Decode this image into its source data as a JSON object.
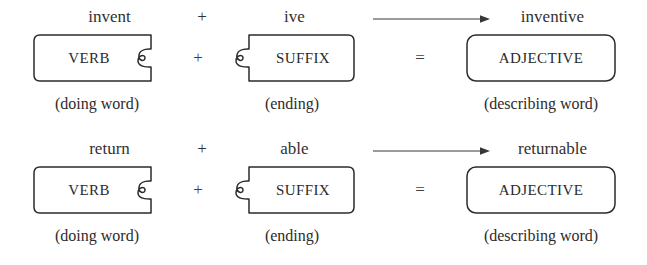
{
  "diagram": {
    "ink_color": "#2b2b2b",
    "background_color": "#ffffff",
    "operators": {
      "plus": "+",
      "equals": "=",
      "arrow": "arrow-right-icon"
    },
    "blocks": {
      "verb": {
        "label": "VERB",
        "caption": "(doing word)",
        "shape": "puzzle-piece-socket-right"
      },
      "suffix": {
        "label": "SUFFIX",
        "caption": "(ending)",
        "shape": "puzzle-piece-tab-left"
      },
      "adjective": {
        "label": "ADJECTIVE",
        "caption": "(describing word)",
        "shape": "rounded-rectangle"
      }
    },
    "rows": [
      {
        "base_word": "invent",
        "plus": "+",
        "suffix_word": "ive",
        "arrow": "arrow-right-icon",
        "result_word": "inventive",
        "verb_label": "VERB",
        "verb_caption": "(doing word)",
        "box_plus": "+",
        "suffix_label": "SUFFIX",
        "suffix_caption": "(ending)",
        "box_equals": "=",
        "adjective_label": "ADJECTIVE",
        "adjective_caption": "(describing word)"
      },
      {
        "base_word": "return",
        "plus": "+",
        "suffix_word": "able",
        "arrow": "arrow-right-icon",
        "result_word": "returnable",
        "verb_label": "VERB",
        "verb_caption": "(doing word)",
        "box_plus": "+",
        "suffix_label": "SUFFIX",
        "suffix_caption": "(ending)",
        "box_equals": "=",
        "adjective_label": "ADJECTIVE",
        "adjective_caption": "(describing word)"
      }
    ]
  }
}
